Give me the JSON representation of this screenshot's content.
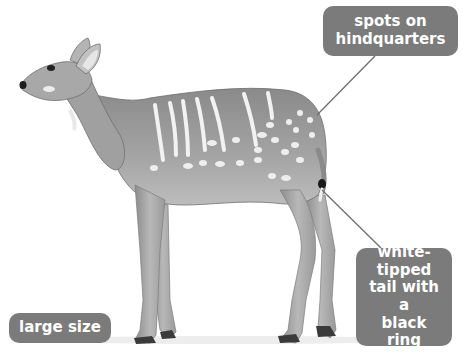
{
  "diagram": {
    "labels": [
      {
        "id": "spots",
        "text": "spots on\nhindquarters"
      },
      {
        "id": "tail",
        "text": "white-\ntipped\ntail with a\nblack ring"
      },
      {
        "id": "size",
        "text": "large size"
      }
    ],
    "colors": {
      "label_bg": "#7b7b7b",
      "label_text": "#ffffff",
      "leader_line": "#6e6e6e",
      "body": "#9a9a9a",
      "stripes": "#f2f2f2"
    }
  }
}
